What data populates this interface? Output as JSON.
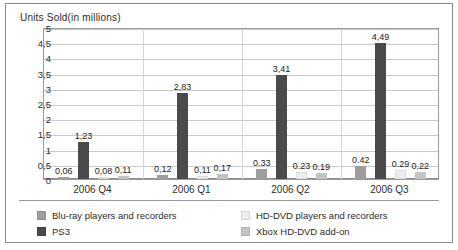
{
  "chart_data": {
    "type": "bar",
    "title": "Units Sold(in millions)",
    "xlabel": "",
    "ylabel": "Units Sold(in millions)",
    "ylim": [
      0,
      5
    ],
    "ytick_labels": [
      "5",
      "4,5",
      "4",
      "3,5",
      "3",
      "2,5",
      "2",
      "1,5",
      "1",
      "0,5",
      "0"
    ],
    "ytick_values": [
      5,
      4.5,
      4,
      3.5,
      3,
      2.5,
      2,
      1.5,
      1,
      0.5,
      0
    ],
    "grid": true,
    "legend_position": "bottom",
    "decimal_separator": ",",
    "categories": [
      "2006 Q4",
      "2006 Q1",
      "2006 Q2",
      "2006 Q3"
    ],
    "series": [
      {
        "name": "Blu-ray players and recorders",
        "color": "#9d9d9d",
        "values": [
          0.06,
          0.12,
          0.33,
          0.42
        ],
        "labels": [
          "0,06",
          "0,12",
          "0.33",
          "0.42"
        ]
      },
      {
        "name": "PS3",
        "color": "#4a4a4a",
        "values": [
          1.23,
          2.83,
          3.41,
          4.49
        ],
        "labels": [
          "1,23",
          "2,83",
          "3,41",
          "4,49"
        ]
      },
      {
        "name": "HD-DVD players and recorders",
        "color": "#ededed",
        "values": [
          0.08,
          0.11,
          0.23,
          0.29
        ],
        "labels": [
          "0,08",
          "0,11",
          "0.23",
          "0.29"
        ]
      },
      {
        "name": "Xbox HD-DVD add-on",
        "color": "#c4c4c4",
        "values": [
          0.11,
          0.17,
          0.19,
          0.22
        ],
        "labels": [
          "0,11",
          "0,17",
          "0.19",
          "0.22"
        ]
      }
    ]
  },
  "legend": {
    "items": [
      {
        "label": "Blu-ray players and recorders",
        "color": "#9d9d9d"
      },
      {
        "label": "PS3",
        "color": "#4a4a4a"
      },
      {
        "label": "HD-DVD players and recorders",
        "color": "#ededed"
      },
      {
        "label": "Xbox HD-DVD add-on",
        "color": "#c4c4c4"
      }
    ]
  }
}
